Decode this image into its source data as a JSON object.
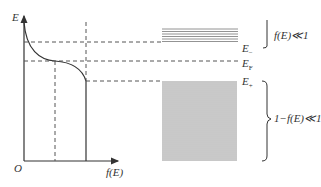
{
  "axes": {
    "y_label": "E",
    "x_label": "f(E)",
    "origin_label": "O"
  },
  "levels": {
    "e_minus": {
      "base": "E",
      "sub": "−"
    },
    "e_fermi": {
      "base": "E",
      "sub": "F"
    },
    "e_plus": {
      "base": "E",
      "sub": "+"
    }
  },
  "annotations": {
    "upper": "f(E)≪1",
    "lower": "1−f(E)≪1"
  },
  "colors": {
    "line": "#333333",
    "dash": "#555555",
    "band": "#777777"
  }
}
